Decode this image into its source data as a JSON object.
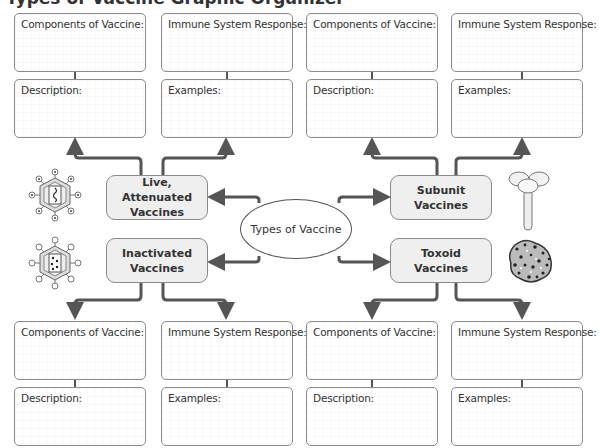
{
  "title": "Types of Vaccine Graphic Organizer",
  "center": {
    "label": "Types of Vaccine"
  },
  "vaccine_types": [
    {
      "label_line1": "Live, Attenuated",
      "label_line2": "Vaccines",
      "icon": "virus-with-rna-icon"
    },
    {
      "label_line1": "Inactivated",
      "label_line2": "Vaccines",
      "icon": "virus-with-dots-icon"
    },
    {
      "label_line1": "Subunit",
      "label_line2": "Vaccines",
      "icon": "protein-subunit-icon"
    },
    {
      "label_line1": "Toxoid",
      "label_line2": "Vaccines",
      "icon": "toxin-molecule-icon"
    }
  ],
  "panels": {
    "components": "Components of Vaccine:",
    "immune": "Immune System Response:",
    "description": "Description:",
    "examples": "Examples:"
  },
  "colors": {
    "arrow": "#555555",
    "label_fill": "#efefef",
    "border": "#8c8c8c"
  }
}
